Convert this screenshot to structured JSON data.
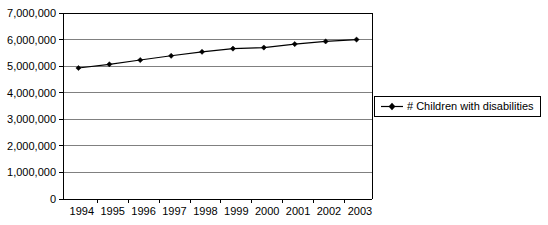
{
  "chart_data": {
    "type": "line",
    "title": "",
    "subtitle": "",
    "xlabel": "",
    "ylabel": "",
    "categories": [
      "1994",
      "1995",
      "1996",
      "1997",
      "1998",
      "1999",
      "2000",
      "2001",
      "2002",
      "2003"
    ],
    "series": [
      {
        "name": "# Children with disabilities",
        "values": [
          4930000,
          5070000,
          5230000,
          5390000,
          5540000,
          5660000,
          5700000,
          5830000,
          5930000,
          6000000
        ]
      }
    ],
    "ylim": [
      0,
      7000000
    ],
    "y_ticks": [
      0,
      1000000,
      2000000,
      3000000,
      4000000,
      5000000,
      6000000,
      7000000
    ],
    "y_tick_labels": [
      "0",
      "1,000,000",
      "2,000,000",
      "3,000,000",
      "4,000,000",
      "5,000,000",
      "6,000,000",
      "7,000,000"
    ],
    "grid": true,
    "grid_color": "#808080",
    "legend_position": "right",
    "legend_entries": [
      "# Children with disabilities"
    ],
    "series_color": "#000000",
    "marker": "diamond",
    "plot_border_color": "#000000",
    "background_color": "#FFFFFF"
  },
  "legend": {
    "label": "# Children with disabilities",
    "marker_name": "diamond-marker"
  },
  "axes": {
    "y_labels": [
      "7,000,000",
      "6,000,000",
      "5,000,000",
      "4,000,000",
      "3,000,000",
      "2,000,000",
      "1,000,000",
      "0"
    ],
    "x_labels": [
      "1994",
      "1995",
      "1996",
      "1997",
      "1998",
      "1999",
      "2000",
      "2001",
      "2002",
      "2003"
    ]
  }
}
